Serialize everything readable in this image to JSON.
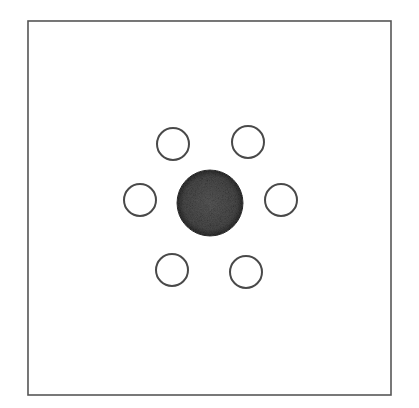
{
  "diagram": {
    "type": "hexagonal-arrangement",
    "colors": {
      "background": "#ffffff",
      "stroke": "#4a4a4a",
      "frame_stroke": "#555555",
      "filled_circle": "#4d4d4d",
      "filled_circle_edge": "#2e2e2e"
    },
    "frame": {
      "x": 28,
      "y": 21,
      "width": 363,
      "height": 374
    },
    "center_circle": {
      "cx": 210,
      "cy": 203,
      "r": 33,
      "filled": true
    },
    "outer_circles": [
      {
        "position": "top-left",
        "cx": 173,
        "cy": 144,
        "r": 16
      },
      {
        "position": "top-right",
        "cx": 248,
        "cy": 142,
        "r": 16
      },
      {
        "position": "left",
        "cx": 140,
        "cy": 200,
        "r": 16
      },
      {
        "position": "right",
        "cx": 281,
        "cy": 200,
        "r": 16
      },
      {
        "position": "bottom-left",
        "cx": 172,
        "cy": 270,
        "r": 16
      },
      {
        "position": "bottom-right",
        "cx": 246,
        "cy": 272,
        "r": 16
      }
    ]
  }
}
